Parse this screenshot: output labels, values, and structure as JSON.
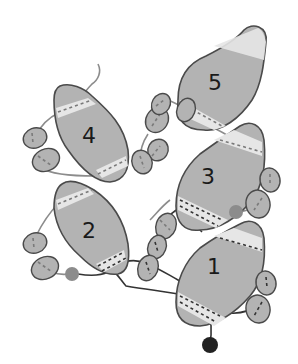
{
  "diagram": {
    "type": "beading-pattern",
    "colors": {
      "bead_fill": "#b3b3b3",
      "bead_outline": "#4a4a4a",
      "hole_band": "#e6e6e6",
      "thread_first_pass": "#8c8c8c",
      "thread_second_pass": "#333333",
      "small_round_gray": "#8c8c8c",
      "small_round_black": "#222222"
    },
    "large_beads": [
      {
        "label": "1"
      },
      {
        "label": "2"
      },
      {
        "label": "3"
      },
      {
        "label": "4"
      },
      {
        "label": "5"
      }
    ],
    "seed_bead_count": 12,
    "small_round_beads": [
      "gray",
      "black"
    ]
  }
}
